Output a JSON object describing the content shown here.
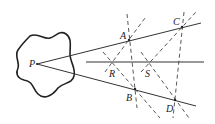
{
  "diagram": {
    "labels": {
      "P": "P",
      "A": "A",
      "B": "B",
      "C": "C",
      "D": "D",
      "R": "R",
      "S": "S"
    },
    "colors": {
      "stroke": "#333333",
      "background": "#ffffff"
    }
  }
}
